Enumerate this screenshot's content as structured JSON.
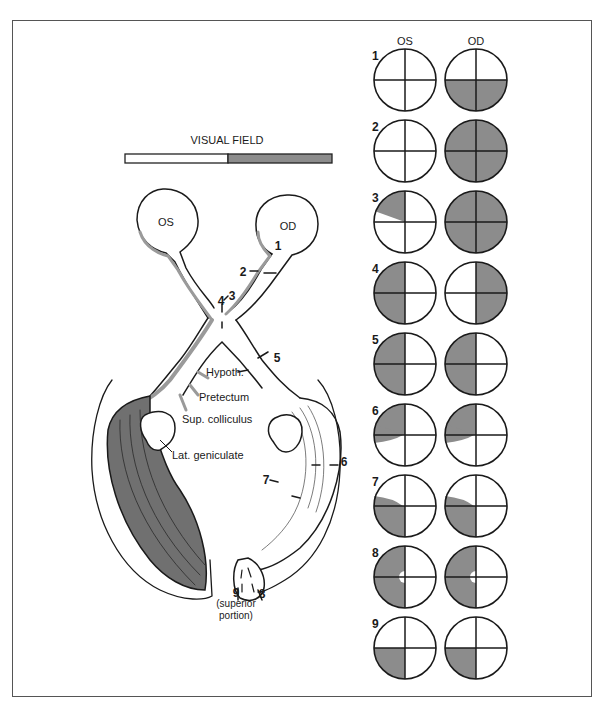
{
  "header": {
    "col_os": "OS",
    "col_od": "OD",
    "visual_field_title": "VISUAL FIELD"
  },
  "colors": {
    "shade": "#8c8c8c",
    "shade_dark": "#6f6f6f",
    "line": "#1a1a1a",
    "frame": "#555555"
  },
  "anatomy": {
    "eye_left": "OS",
    "eye_right": "OD",
    "hypoth": "Hypoth.",
    "pretectum": "Pretectum",
    "sup_colliculus": "Sup. colliculus",
    "lat_geniculate": "Lat. geniculate",
    "superior_portion_1": "(superior",
    "superior_portion_2": "portion)"
  },
  "lesion_labels": [
    "1",
    "2",
    "3",
    "4",
    "5",
    "6",
    "7",
    "8",
    "9"
  ],
  "fields": [
    {
      "row": "1",
      "os": "none",
      "od": "lower-half"
    },
    {
      "row": "2",
      "os": "none",
      "od": "full"
    },
    {
      "row": "3",
      "os": "upper-left-wedge",
      "od": "full"
    },
    {
      "row": "4",
      "os": "left-half",
      "od": "right-half"
    },
    {
      "row": "5",
      "os": "left-half",
      "od": "left-half"
    },
    {
      "row": "6",
      "os": "upper-left-quadrantanopia",
      "od": "upper-left-quadrantanopia"
    },
    {
      "row": "7",
      "os": "lower-left-quadrantanopia",
      "od": "lower-left-quadrantanopia"
    },
    {
      "row": "8",
      "os": "left-half-macular-sparing",
      "od": "left-half-macular-sparing"
    },
    {
      "row": "9",
      "os": "lower-left-quadrant",
      "od": "lower-left-quadrant"
    }
  ]
}
